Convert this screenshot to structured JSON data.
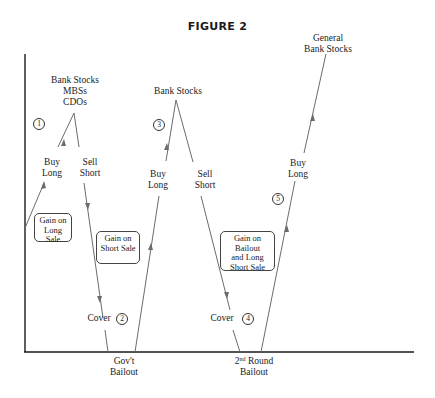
{
  "figure": {
    "title": "FIGURE 2"
  },
  "peaks": {
    "peak1": [
      "Bank Stocks",
      "MBSs",
      "CDOs"
    ],
    "peak2": "Bank Stocks",
    "peak3": [
      "General",
      "Bank Stocks"
    ]
  },
  "actions": {
    "buy_long": [
      "Buy",
      "Long"
    ],
    "sell_short": [
      "Sell",
      "Short"
    ],
    "cover": "Cover"
  },
  "steps": [
    "1",
    "2",
    "3",
    "4",
    "5"
  ],
  "boxes": {
    "gain_long_sale": [
      "Gain on",
      "Long Sale"
    ],
    "gain_short_sale": [
      "Gain on",
      "Short Sale"
    ],
    "gain_bailout": [
      "Gain on Bailout",
      "and Long",
      "Short Sale"
    ]
  },
  "x_axis_labels": {
    "govt_bailout": [
      "Gov't",
      "Bailout"
    ],
    "second_round": {
      "ordinal": "2",
      "suffix": "nd",
      "word": "Round",
      "line2": "Bailout"
    }
  },
  "colors": {
    "line": "#6b6b6b",
    "axis": "#1a1a1a",
    "text": "#222222"
  }
}
